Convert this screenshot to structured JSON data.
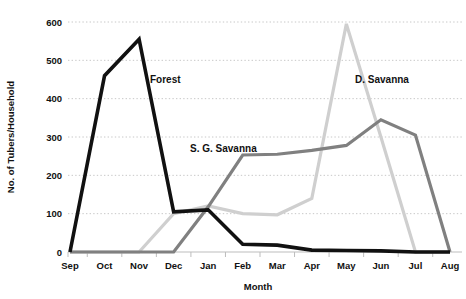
{
  "chart_data": {
    "type": "line",
    "title": "",
    "xlabel": "Month",
    "ylabel": "No. of Tubers/Household",
    "categories": [
      "Sep",
      "Oct",
      "Nov",
      "Dec",
      "Jan",
      "Feb",
      "Mar",
      "Apr",
      "May",
      "Jun",
      "Jul",
      "Aug"
    ],
    "ylim": [
      0,
      600
    ],
    "xlim_labels": [
      "Sep",
      "Aug"
    ],
    "yticks": [
      0,
      100,
      200,
      300,
      400,
      500,
      600
    ],
    "ytick_labels": [
      "0",
      "100",
      "200",
      "300",
      "400",
      "500",
      "600"
    ],
    "grid": true,
    "grid_axis": "y",
    "legend_position": "inline-annotations",
    "series": [
      {
        "name": "Forest",
        "color": "#111111",
        "label_x_category": "Nov",
        "values": [
          0,
          460,
          555,
          105,
          110,
          20,
          18,
          5,
          4,
          3,
          0,
          0
        ]
      },
      {
        "name": "S. G. Savanna",
        "color": "#808080",
        "label_x_category": "Jan",
        "values": [
          0,
          0,
          0,
          0,
          118,
          253,
          255,
          265,
          278,
          345,
          305,
          0
        ]
      },
      {
        "name": "D. Savanna",
        "color": "#cfcfcf",
        "label_x_category": "Jun",
        "values": [
          0,
          0,
          0,
          100,
          120,
          100,
          97,
          140,
          595,
          300,
          0,
          0
        ]
      }
    ],
    "annotations": [
      {
        "text": "Forest",
        "series": "Forest"
      },
      {
        "text": "S. G. Savanna",
        "series": "S. G. Savanna"
      },
      {
        "text": "D. Savanna",
        "series": "D. Savanna"
      }
    ]
  }
}
